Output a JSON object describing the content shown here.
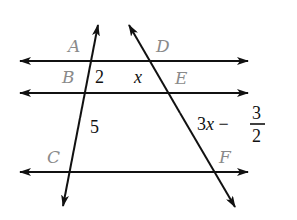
{
  "diagram": {
    "type": "parallel-lines-with-transversals",
    "colors": {
      "line": "#111111",
      "point_label": "#8a8a8a",
      "value_label": "#111111"
    },
    "points": {
      "A": "A",
      "B": "B",
      "C": "C",
      "D": "D",
      "E": "E",
      "F": "F"
    },
    "segment_labels": {
      "AB_top": "2",
      "DE_top": "x",
      "BC": "5",
      "EF_expr": "3x −",
      "EF_frac_num": "3",
      "EF_frac_den": "2"
    },
    "lines": [
      {
        "name": "top-parallel",
        "through": [
          "A",
          "D"
        ]
      },
      {
        "name": "middle-parallel",
        "through": [
          "B",
          "E"
        ]
      },
      {
        "name": "bottom-parallel",
        "through": [
          "C",
          "F"
        ]
      },
      {
        "name": "left-transversal",
        "through": [
          "A",
          "B",
          "C"
        ]
      },
      {
        "name": "right-transversal",
        "through": [
          "D",
          "E",
          "F"
        ]
      }
    ]
  }
}
